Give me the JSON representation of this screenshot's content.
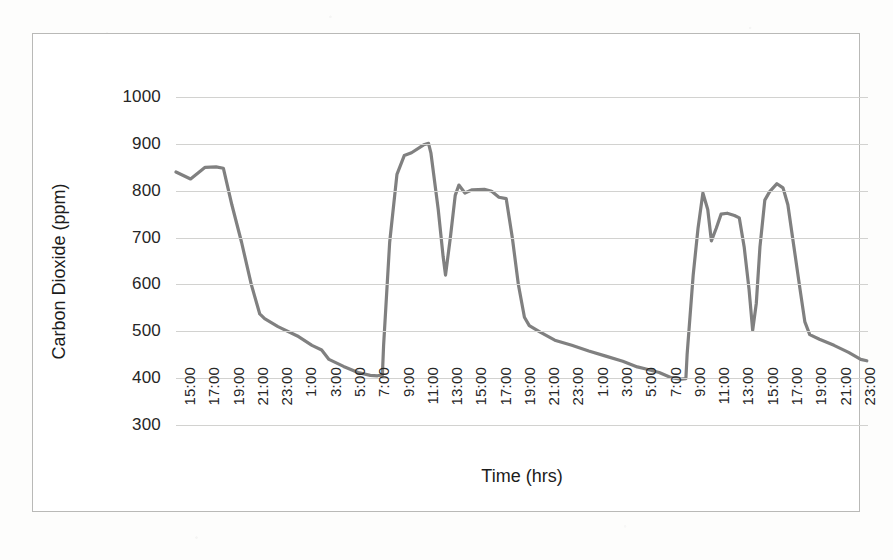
{
  "chart_data": {
    "type": "line",
    "title": "",
    "xlabel": "Time (hrs)",
    "ylabel": "Carbon Dioxide (ppm)",
    "ylim": [
      300,
      1000
    ],
    "ytick_labels": [
      "1000",
      "900",
      "800",
      "700",
      "600",
      "500",
      "400",
      "300"
    ],
    "ytick_values": [
      1000,
      900,
      800,
      700,
      600,
      500,
      400,
      300
    ],
    "grid": true,
    "legend": "none",
    "series_color": "#808080",
    "xtick_labels": [
      "15:00",
      "17:00",
      "19:00",
      "21:00",
      "23:00",
      "1:00",
      "3:00",
      "5:00",
      "7:00",
      "9:00",
      "11:00",
      "13:00",
      "15:00",
      "17:00",
      "19:00",
      "21:00",
      "23:00",
      "1:00",
      "3:00",
      "5:00",
      "7:00",
      "9:00",
      "11:00",
      "13:00",
      "15:00",
      "17:00",
      "19:00",
      "21:00",
      "23:00"
    ],
    "x_hours": [
      15,
      17,
      19,
      21,
      23,
      25,
      27,
      29,
      31,
      33,
      35,
      37,
      39,
      41,
      43,
      45,
      47,
      49,
      51,
      53,
      55,
      57,
      59,
      61,
      63,
      65,
      67,
      69,
      71
    ],
    "series": [
      {
        "name": "Carbon Dioxide",
        "color": "#808080",
        "points": [
          [
            15.0,
            840
          ],
          [
            16.2,
            825
          ],
          [
            17.4,
            850
          ],
          [
            18.3,
            851
          ],
          [
            18.9,
            848
          ],
          [
            19.6,
            770
          ],
          [
            20.4,
            690
          ],
          [
            21.2,
            600
          ],
          [
            21.9,
            537
          ],
          [
            22.3,
            527
          ],
          [
            23.4,
            510
          ],
          [
            25.0,
            490
          ],
          [
            26.2,
            470
          ],
          [
            27.0,
            460
          ],
          [
            27.6,
            440
          ],
          [
            28.8,
            425
          ],
          [
            30.0,
            412
          ],
          [
            31.0,
            406
          ],
          [
            31.6,
            405
          ],
          [
            32.0,
            407
          ],
          [
            32.1,
            470
          ],
          [
            32.6,
            690
          ],
          [
            33.2,
            835
          ],
          [
            33.8,
            875
          ],
          [
            34.4,
            881
          ],
          [
            35.4,
            898
          ],
          [
            35.8,
            901
          ],
          [
            36.0,
            880
          ],
          [
            36.6,
            760
          ],
          [
            37.0,
            660
          ],
          [
            37.2,
            620
          ],
          [
            37.6,
            700
          ],
          [
            38.0,
            790
          ],
          [
            38.3,
            812
          ],
          [
            38.8,
            795
          ],
          [
            39.4,
            802
          ],
          [
            40.4,
            803
          ],
          [
            41.0,
            799
          ],
          [
            41.6,
            786
          ],
          [
            42.2,
            783
          ],
          [
            42.7,
            700
          ],
          [
            43.2,
            600
          ],
          [
            43.7,
            530
          ],
          [
            44.1,
            512
          ],
          [
            45.0,
            498
          ],
          [
            46.2,
            481
          ],
          [
            47.6,
            470
          ],
          [
            49.0,
            458
          ],
          [
            50.4,
            447
          ],
          [
            51.8,
            436
          ],
          [
            53.0,
            424
          ],
          [
            53.8,
            419
          ],
          [
            54.8,
            412
          ],
          [
            55.8,
            401
          ],
          [
            56.6,
            398
          ],
          [
            57.0,
            399
          ],
          [
            57.1,
            450
          ],
          [
            57.6,
            620
          ],
          [
            58.0,
            720
          ],
          [
            58.4,
            795
          ],
          [
            58.8,
            760
          ],
          [
            59.1,
            693
          ],
          [
            59.5,
            720
          ],
          [
            59.9,
            750
          ],
          [
            60.4,
            752
          ],
          [
            61.0,
            747
          ],
          [
            61.4,
            742
          ],
          [
            61.8,
            680
          ],
          [
            62.2,
            590
          ],
          [
            62.5,
            502
          ],
          [
            62.8,
            560
          ],
          [
            63.1,
            680
          ],
          [
            63.5,
            780
          ],
          [
            63.9,
            798
          ],
          [
            64.5,
            815
          ],
          [
            65.0,
            806
          ],
          [
            65.4,
            770
          ],
          [
            65.9,
            680
          ],
          [
            66.4,
            590
          ],
          [
            66.8,
            520
          ],
          [
            67.2,
            493
          ],
          [
            68.0,
            483
          ],
          [
            69.2,
            470
          ],
          [
            70.4,
            455
          ],
          [
            71.4,
            440
          ],
          [
            71.9,
            437
          ]
        ]
      }
    ]
  },
  "figure": {
    "x_axis_title": "Time (hrs)",
    "y_axis_title": "Carbon Dioxide (ppm)"
  }
}
